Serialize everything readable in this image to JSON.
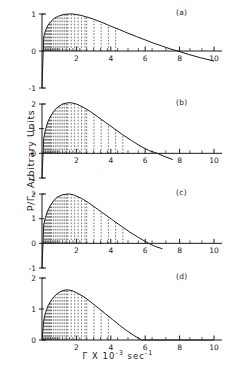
{
  "chart_data": {
    "type": "line",
    "title": "",
    "xlabel": "Γ X 10-3 sec-1",
    "xlabel_parts": {
      "symbol": "Γ",
      "times": "X",
      "base": "10",
      "exp": "-3",
      "unit": "sec",
      "unit_exp": "-1"
    },
    "ylabel": "P/Γ, Arbitrary Units",
    "xlim": [
      0,
      10
    ],
    "xticks": [
      2,
      4,
      6,
      8,
      10
    ],
    "xticklabels": [
      "2",
      "4",
      "6",
      "8",
      "10"
    ],
    "grid": false,
    "legend": null,
    "shading": "vertical dashed hatch lines under curve",
    "panels": [
      {
        "label": "(a)",
        "ylim": [
          -1,
          1
        ],
        "yticks": [
          -1,
          0,
          1
        ],
        "yticklabels": [
          "-1",
          "0",
          "1"
        ],
        "peak_x": 1.8,
        "peak_y": 1.0,
        "zero_crossing_x": 7.9,
        "hatch_xmax": 4.4,
        "x": [
          0.0,
          0.1,
          0.2,
          0.35,
          0.5,
          0.7,
          0.9,
          1.2,
          1.5,
          1.8,
          2.2,
          2.6,
          3.0,
          3.5,
          4.0,
          4.5,
          5.0,
          5.5,
          6.0,
          6.5,
          7.0,
          7.5,
          7.9,
          8.5,
          9.2,
          10.0
        ],
        "y": [
          -1.0,
          0.38,
          0.55,
          0.7,
          0.79,
          0.88,
          0.93,
          0.98,
          1.0,
          1.0,
          0.97,
          0.92,
          0.86,
          0.77,
          0.67,
          0.58,
          0.48,
          0.39,
          0.3,
          0.21,
          0.13,
          0.05,
          0.0,
          -0.09,
          -0.18,
          -0.27
        ]
      },
      {
        "label": "(b)",
        "ylim": [
          -1,
          2
        ],
        "yticks": [
          -1,
          0,
          1,
          2
        ],
        "yticklabels": [
          "-1",
          "0",
          "1",
          "2"
        ],
        "peak_x": 1.7,
        "peak_y": 2.05,
        "zero_crossing_x": 6.7,
        "hatch_xmax": 5.0,
        "x": [
          0.0,
          0.1,
          0.2,
          0.35,
          0.5,
          0.7,
          0.9,
          1.2,
          1.5,
          1.7,
          2.0,
          2.4,
          2.8,
          3.2,
          3.7,
          4.2,
          4.7,
          5.2,
          5.7,
          6.2,
          6.7,
          7.2,
          7.6
        ],
        "y": [
          -1.0,
          0.6,
          0.95,
          1.3,
          1.5,
          1.72,
          1.87,
          2.0,
          2.05,
          2.05,
          2.0,
          1.87,
          1.7,
          1.5,
          1.25,
          1.0,
          0.75,
          0.52,
          0.3,
          0.12,
          0.0,
          -0.15,
          -0.25
        ]
      },
      {
        "label": "(c)",
        "ylim": [
          -1,
          2
        ],
        "yticks": [
          -1,
          0,
          1,
          2
        ],
        "yticklabels": [
          "-1",
          "0",
          "1",
          "2"
        ],
        "peak_x": 1.6,
        "peak_y": 2.0,
        "zero_crossing_x": 6.2,
        "hatch_xmax": 4.7,
        "x": [
          0.0,
          0.1,
          0.2,
          0.35,
          0.5,
          0.7,
          0.9,
          1.2,
          1.5,
          1.6,
          1.9,
          2.3,
          2.7,
          3.1,
          3.6,
          4.1,
          4.6,
          5.1,
          5.6,
          6.2,
          6.6,
          7.0
        ],
        "y": [
          -1.0,
          0.75,
          1.05,
          1.35,
          1.55,
          1.75,
          1.88,
          1.97,
          2.0,
          2.0,
          1.95,
          1.82,
          1.65,
          1.45,
          1.2,
          0.95,
          0.7,
          0.46,
          0.24,
          0.0,
          -0.13,
          -0.22
        ]
      },
      {
        "label": "(d)",
        "ylim": [
          0,
          2
        ],
        "yticks": [
          0,
          1,
          2
        ],
        "yticklabels": [
          "0",
          "1",
          "2"
        ],
        "peak_x": 1.5,
        "peak_y": 1.62,
        "zero_crossing_x": 5.8,
        "hatch_xmax": 4.1,
        "x": [
          0.0,
          0.1,
          0.2,
          0.35,
          0.5,
          0.7,
          0.9,
          1.1,
          1.35,
          1.5,
          1.8,
          2.1,
          2.5,
          2.9,
          3.3,
          3.7,
          4.1,
          4.5,
          4.9,
          5.3,
          5.8,
          6.5,
          10.0
        ],
        "y": [
          0.0,
          0.62,
          0.88,
          1.1,
          1.25,
          1.4,
          1.5,
          1.57,
          1.61,
          1.62,
          1.58,
          1.5,
          1.37,
          1.2,
          1.02,
          0.84,
          0.66,
          0.48,
          0.31,
          0.16,
          0.0,
          0.0,
          0.0
        ]
      }
    ]
  },
  "axes": {
    "tick_color": "#1a1a1a",
    "curve_color": "#1a1a1a",
    "hatch_color": "#333333"
  }
}
